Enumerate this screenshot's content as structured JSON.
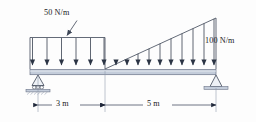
{
  "figure": {
    "type": "beam-load-diagram"
  },
  "loads": {
    "uniform": {
      "label": "50 N/m",
      "magnitude": 50,
      "unit": "N/m",
      "shape": "rectangular",
      "span_m": 3,
      "arrow_count": 6,
      "start_m": 0,
      "end_m": 3
    },
    "triangular": {
      "label": "100 N/m",
      "magnitude_start": 0,
      "magnitude_end": 100,
      "unit": "N/m",
      "shape": "triangular",
      "span_m": 5,
      "arrow_count": 10,
      "start_m": 3,
      "end_m": 8
    }
  },
  "supports": {
    "left": {
      "name": "roller-support",
      "type": "roller",
      "position_m": 0,
      "roller_count": 3,
      "hatched_ground": true
    },
    "right": {
      "name": "pin-support",
      "type": "pin",
      "position_m": 8,
      "hatched_ground": false
    }
  },
  "dimensions": [
    {
      "label": "3 m",
      "value": 3,
      "unit": "m",
      "from_m": 0,
      "to_m": 3
    },
    {
      "label": "5 m",
      "value": 5,
      "unit": "m",
      "from_m": 3,
      "to_m": 8
    }
  ],
  "colors": {
    "line": "#3c4556",
    "beam_fill": "#c3ccda",
    "beam_edge": "#6b7488",
    "arrow": "#2b3444",
    "ground": "#9aa3b4",
    "text": "#1a1a22",
    "dim_line": "#4a5264"
  }
}
